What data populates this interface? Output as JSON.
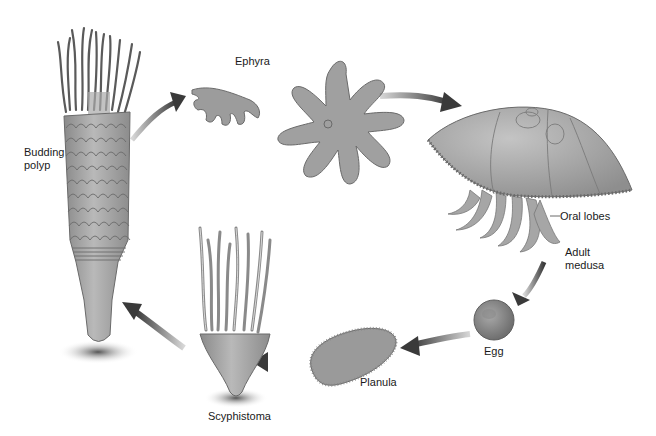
{
  "diagram": {
    "stages": [
      {
        "id": "budding-polyp",
        "label_line1": "Budding",
        "label_line2": "polyp"
      },
      {
        "id": "ephyra",
        "label": "Ephyra"
      },
      {
        "id": "adult-medusa",
        "label_line1": "Adult",
        "label_line2": "medusa"
      },
      {
        "id": "oral-lobes",
        "label": "Oral lobes"
      },
      {
        "id": "egg",
        "label": "Egg"
      },
      {
        "id": "planula",
        "label": "Planula"
      },
      {
        "id": "scyphistoma",
        "label": "Scyphistoma"
      }
    ],
    "cycle_order": [
      "Scyphistoma",
      "Budding polyp",
      "Ephyra",
      "Adult medusa",
      "Egg",
      "Planula",
      "Scyphistoma"
    ],
    "colors": {
      "tissue": "#9a9a9a",
      "tissue_dark": "#6e6e6e",
      "arrow": "#3c3c3c",
      "label": "#1a1a1a",
      "background": "#ffffff"
    }
  }
}
